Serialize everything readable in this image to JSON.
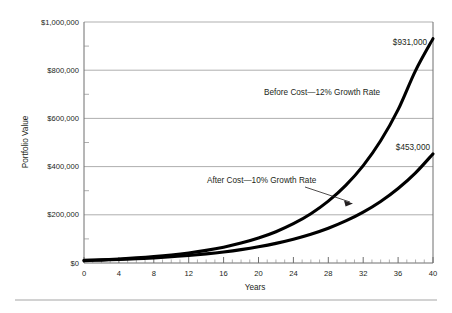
{
  "chart_data": {
    "type": "line",
    "title": "",
    "xlabel": "Years",
    "ylabel": "Portfolio Value",
    "xlim": [
      0,
      40
    ],
    "ylim": [
      0,
      1000000
    ],
    "grid": "horizontal",
    "legend_position": "inline-annotations",
    "x_tick_labels": [
      "0",
      "4",
      "8",
      "12",
      "16",
      "20",
      "24",
      "28",
      "32",
      "36",
      "40"
    ],
    "x_ticks": [
      0,
      4,
      8,
      12,
      16,
      20,
      24,
      28,
      32,
      36,
      40
    ],
    "x_minor_tick_step": 1,
    "y_tick_labels": [
      "$0",
      "$200,000",
      "$400,000",
      "$600,000",
      "$800,000",
      "$1,000,000"
    ],
    "y_ticks": [
      0,
      200000,
      400000,
      600000,
      800000,
      1000000
    ],
    "y_minor_ticks": [
      100000,
      300000,
      500000,
      700000,
      900000
    ],
    "x": [
      0,
      2,
      4,
      6,
      8,
      10,
      12,
      14,
      16,
      18,
      20,
      22,
      24,
      26,
      28,
      30,
      32,
      34,
      36,
      38,
      40
    ],
    "series": [
      {
        "name": "Before Cost—12% Growth Rate",
        "annotation": "Before Cost—12% Growth Rate",
        "growth_rate": "12%",
        "end_label": "$931,000",
        "end_value": 931000,
        "color": "#000000",
        "values": [
          10700,
          13420,
          16840,
          21130,
          26510,
          33270,
          41750,
          52390,
          65740,
          82480,
          103500,
          129880,
          162990,
          204530,
          256640,
          322030,
          404100,
          507090,
          636320,
          798510,
          931000
        ]
      },
      {
        "name": "After Cost—10% Growth Rate",
        "annotation": "After Cost—10% Growth Rate",
        "growth_rate": "10%",
        "end_label": "$453,000",
        "end_value": 453000,
        "color": "#000000",
        "values": [
          10000,
          12100,
          14640,
          17720,
          21440,
          25940,
          31380,
          37980,
          45950,
          55600,
          67270,
          81400,
          98500,
          119180,
          144210,
          174490,
          211140,
          255470,
          309110,
          374020,
          453000
        ]
      }
    ]
  },
  "annotations": {
    "before_cost": "Before Cost—12% Growth Rate",
    "after_cost": "After Cost—10% Growth Rate",
    "end_label_top": "$931,000",
    "end_label_bottom": "$453,000"
  },
  "axes": {
    "y_title": "Portfolio Value",
    "x_title": "Years",
    "y_labels": [
      "$1,000,000",
      "$800,000",
      "$600,000",
      "$400,000",
      "$200,000",
      "$0"
    ],
    "x_labels": [
      "0",
      "4",
      "8",
      "12",
      "16",
      "20",
      "24",
      "28",
      "32",
      "36",
      "40"
    ]
  }
}
